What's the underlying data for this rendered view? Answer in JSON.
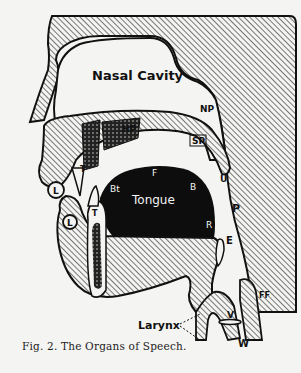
{
  "figure": {
    "caption": "Fig. 2.  The Organs of Speech.",
    "labels": {
      "nasal_cavity": "Nasal Cavity",
      "np": "NP",
      "hp": "HP",
      "sp": "SP",
      "u": "U",
      "l_upper": "L",
      "t_upper": "T",
      "l_lower": "L",
      "t_lower": "T",
      "bt": "Bt",
      "f": "F",
      "b": "B",
      "tongue": "Tongue",
      "r": "R",
      "p": "P",
      "e": "E",
      "ff": "FF",
      "v": "V",
      "w": "W",
      "larynx": "Larynx"
    },
    "colors": {
      "ink": "#111111",
      "paper": "#f4f4f2"
    }
  }
}
